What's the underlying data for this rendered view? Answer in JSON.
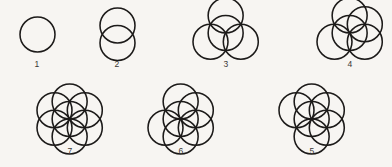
{
  "diagram": {
    "background_color": "#f7f5f2",
    "stroke_color": "#1c1a19",
    "stroke_width": 1.55,
    "circle_radius": 17.5,
    "figures": [
      {
        "label": "1",
        "circle_count": 1,
        "center": {
          "x": 37,
          "y": 34
        },
        "label_pos": {
          "x": 22,
          "y": 59
        },
        "circles": [
          {
            "cx": 0,
            "cy": 0
          }
        ]
      },
      {
        "label": "2",
        "circle_count": 2,
        "center": {
          "x": 117,
          "y": 34
        },
        "label_pos": {
          "x": 102,
          "y": 59
        },
        "circles": [
          {
            "cx": 0,
            "cy": 8.75
          },
          {
            "cx": 0,
            "cy": -8.75
          }
        ]
      },
      {
        "label": "3",
        "circle_count": 4,
        "center": {
          "x": 226,
          "y": 33
        },
        "label_pos": {
          "x": 211,
          "y": 59
        },
        "circles": [
          {
            "cx": 0,
            "cy": 0
          },
          {
            "cx": 0,
            "cy": -17.5
          },
          {
            "cx": 15.155,
            "cy": 8.75
          },
          {
            "cx": -15.155,
            "cy": 8.75
          }
        ]
      },
      {
        "label": "4",
        "circle_count": 5,
        "center": {
          "x": 350,
          "y": 33
        },
        "label_pos": {
          "x": 335,
          "y": 59
        },
        "circles": [
          {
            "cx": 0,
            "cy": 0
          },
          {
            "cx": 0,
            "cy": -17.5
          },
          {
            "cx": 15.155,
            "cy": -8.75
          },
          {
            "cx": 15.155,
            "cy": 8.75
          },
          {
            "cx": -15.155,
            "cy": 8.75
          }
        ]
      },
      {
        "label": "7",
        "circle_count": 7,
        "center": {
          "x": 70,
          "y": 119
        },
        "label_pos": {
          "x": 55,
          "y": 146
        },
        "circles": [
          {
            "cx": 0,
            "cy": 0
          },
          {
            "cx": 0,
            "cy": -17.5
          },
          {
            "cx": 15.155,
            "cy": -8.75
          },
          {
            "cx": 15.155,
            "cy": 8.75
          },
          {
            "cx": 0,
            "cy": 17.5
          },
          {
            "cx": -15.155,
            "cy": 8.75
          },
          {
            "cx": -15.155,
            "cy": -8.75
          }
        ]
      },
      {
        "label": "6",
        "circle_count": 6,
        "center": {
          "x": 181,
          "y": 119
        },
        "label_pos": {
          "x": 166,
          "y": 146
        },
        "circles": [
          {
            "cx": 0,
            "cy": 0
          },
          {
            "cx": 0,
            "cy": -17.5
          },
          {
            "cx": 15.155,
            "cy": -8.75
          },
          {
            "cx": 15.155,
            "cy": 8.75
          },
          {
            "cx": 0,
            "cy": 17.5
          },
          {
            "cx": -15.155,
            "cy": 8.75
          }
        ]
      },
      {
        "label": "5",
        "circle_count": 6,
        "center": {
          "x": 312,
          "y": 119
        },
        "label_pos": {
          "x": 297,
          "y": 146
        },
        "circles": [
          {
            "cx": 0,
            "cy": 0
          },
          {
            "cx": 0,
            "cy": -17.5
          },
          {
            "cx": 15.155,
            "cy": -8.75
          },
          {
            "cx": 15.155,
            "cy": 8.75
          },
          {
            "cx": 0,
            "cy": 17.5
          },
          {
            "cx": -15.155,
            "cy": -8.75
          }
        ]
      }
    ]
  }
}
